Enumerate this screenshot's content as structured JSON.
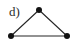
{
  "figure": {
    "label": "d)",
    "background_color": "#ffffff",
    "width": 76,
    "height": 50
  },
  "graph": {
    "name": "triangle-graph",
    "type": "undirected-graph",
    "node_color": "#121212",
    "edge_color": "#262626",
    "node_radius": 3,
    "edge_width": 1.1,
    "nodes": [
      {
        "id": "apex",
        "x": 39,
        "y": 10
      },
      {
        "id": "bottom-left",
        "x": 11,
        "y": 36
      },
      {
        "id": "bottom-right",
        "x": 67,
        "y": 36
      }
    ],
    "edges": [
      {
        "from": "bottom-left",
        "to": "apex",
        "x1": 11,
        "y1": 36,
        "x2": 39,
        "y2": 10
      },
      {
        "from": "apex",
        "to": "bottom-right",
        "x1": 39,
        "y1": 10,
        "x2": 67,
        "y2": 36
      },
      {
        "from": "bottom-left",
        "to": "bottom-right",
        "x1": 11,
        "y1": 36,
        "x2": 67,
        "y2": 36
      }
    ],
    "node_count": 3,
    "edge_count": 3
  }
}
